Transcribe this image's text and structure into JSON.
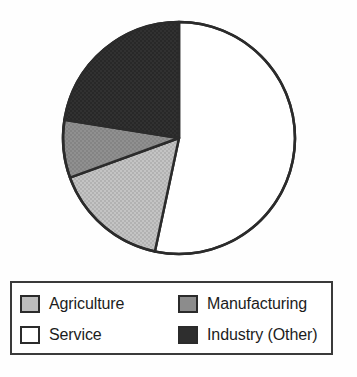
{
  "chart_data": {
    "type": "pie",
    "title": "",
    "subtitle": "",
    "labels": [
      "Agriculture",
      "Service",
      "Manufacturing",
      "Industry (Other)"
    ],
    "values": [
      16,
      53,
      8,
      23
    ],
    "unit": "percent",
    "legend_position": "bottom",
    "grid": false,
    "start_angle_deg": 0,
    "direction": "clockwise",
    "slices": [
      {
        "name": "Service",
        "label": "Service",
        "value": 53,
        "color": "#ffffff",
        "start_angle_deg": 0,
        "end_angle_deg": 192,
        "swatch": "swatch-service"
      },
      {
        "name": "Agriculture",
        "label": "Agriculture",
        "value": 16,
        "color": "#bdbdbd",
        "start_angle_deg": 192,
        "end_angle_deg": 250,
        "swatch": "swatch-agriculture"
      },
      {
        "name": "Manufacturing",
        "label": "Manufacturing",
        "value": 8,
        "color": "#8c8c8c",
        "start_angle_deg": 250,
        "end_angle_deg": 279,
        "swatch": "swatch-manufacturing"
      },
      {
        "name": "Industry (Other)",
        "label": "Industry (Other)",
        "value": 23,
        "color": "#2e2e2e",
        "start_angle_deg": 279,
        "end_angle_deg": 360,
        "swatch": "swatch-industry"
      }
    ],
    "geometry": {
      "center_x": 179,
      "center_y": 138,
      "radius": 116,
      "outline_color": "#2b2b2b",
      "outline_width": 2.5
    }
  },
  "legend": {
    "border_color": "#3a3a3a",
    "background": "#ffffff",
    "rows": [
      {
        "left": {
          "label": "Agriculture",
          "swatch": "swatch-agriculture",
          "color": "#bdbdbd"
        },
        "right": {
          "label": "Manufacturing",
          "swatch": "swatch-manufacturing",
          "color": "#8c8c8c"
        }
      },
      {
        "left": {
          "label": "Service",
          "swatch": "swatch-service",
          "color": "#ffffff"
        },
        "right": {
          "label": "Industry (Other)",
          "swatch": "swatch-industry",
          "color": "#2e2e2e"
        }
      }
    ]
  }
}
